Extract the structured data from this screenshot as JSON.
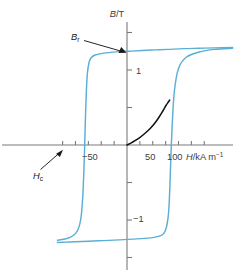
{
  "chart_data": {
    "type": "line",
    "title": "",
    "xlabel": "H/kA m⁻¹",
    "xlabel_parts": {
      "symbol": "H",
      "unit": "/kA m",
      "exponent": "−1"
    },
    "ylabel": "B/T",
    "ylabel_parts": {
      "symbol": "B",
      "unit": "/T"
    },
    "xlim": [
      -135,
      210
    ],
    "ylim": [
      -1.62,
      1.62
    ],
    "grid": false,
    "legend_position": "none",
    "x_ticks": [
      -125,
      -100,
      -75,
      -50,
      -25,
      25,
      50,
      75,
      100,
      125,
      150
    ],
    "x_tick_labels": {
      "-50": "−50",
      "50": "50",
      "100": "100"
    },
    "y_ticks": [
      -1.5,
      -1.0,
      -0.5,
      0.5,
      1.0,
      1.5
    ],
    "y_tick_labels": {
      "1.5": "1.5",
      "1": "1",
      "-1": "−1",
      "-1.5": "−1.5"
    },
    "colors": {
      "loop": "#5BAFD7",
      "initial_curve": "#111111",
      "axis": "#7a7a7a",
      "text": "#3d3d3d",
      "annotation": "#1a1a1a"
    },
    "annotations": [
      {
        "name": "remanence",
        "label": "B",
        "subscript": "r",
        "value": 1.25,
        "units": "T",
        "points_to": {
          "x": 0,
          "y": 1.25
        }
      },
      {
        "name": "coercivity",
        "label": "H",
        "subscript": "c",
        "value": -77,
        "units": "kA m⁻¹",
        "points_to": {
          "x": -77,
          "y": 0
        }
      }
    ],
    "series": [
      {
        "name": "upper branch (decreasing H)",
        "comment": "field decreasing from positive saturation to negative saturation",
        "x": [
          205,
          170,
          140,
          110,
          80,
          55,
          30,
          10,
          0,
          -20,
          -45,
          -62,
          -70,
          -74,
          -77,
          -79,
          -81,
          -83,
          -86,
          -90,
          -96,
          -105,
          -118,
          -135
        ],
        "y": [
          1.3,
          1.295,
          1.29,
          1.285,
          1.275,
          1.268,
          1.26,
          1.252,
          1.25,
          1.242,
          1.225,
          1.2,
          1.16,
          1.09,
          0.95,
          0.7,
          0.3,
          -0.2,
          -0.7,
          -1.0,
          -1.14,
          -1.21,
          -1.25,
          -1.27
        ]
      },
      {
        "name": "lower branch (increasing H)",
        "comment": "field increasing from negative saturation to positive saturation",
        "x": [
          -135,
          -118,
          -100,
          -75,
          -45,
          -15,
          10,
          35,
          55,
          68,
          74,
          78,
          81,
          83,
          85,
          88,
          92,
          100,
          115,
          140,
          170,
          205
        ],
        "y": [
          -1.3,
          -1.295,
          -1.29,
          -1.283,
          -1.275,
          -1.265,
          -1.255,
          -1.245,
          -1.228,
          -1.2,
          -1.15,
          -1.05,
          -0.88,
          -0.6,
          -0.2,
          0.3,
          0.72,
          1.02,
          1.17,
          1.24,
          1.275,
          1.29
        ]
      },
      {
        "name": "initial magnetization curve",
        "comment": "virgin curve from origin up to the ascending branch",
        "x": [
          0,
          10,
          22,
          34,
          45,
          55,
          63,
          70,
          76,
          80,
          83
        ],
        "y": [
          0.0,
          0.035,
          0.085,
          0.15,
          0.22,
          0.3,
          0.38,
          0.46,
          0.53,
          0.57,
          0.6
        ]
      }
    ]
  },
  "figure": {
    "background_color": "#ffffff"
  }
}
